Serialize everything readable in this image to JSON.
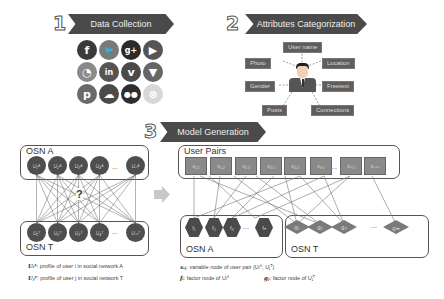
{
  "steps": [
    {
      "number": "1",
      "title": "Data Collection"
    },
    {
      "number": "2",
      "title": "Attributes Categorization"
    },
    {
      "number": "3",
      "title": "Model Generation"
    }
  ],
  "social_icons": [
    {
      "name": "facebook-icon",
      "glyph": "f",
      "color": "#3a3a3a"
    },
    {
      "name": "twitter-icon",
      "glyph": "🐦",
      "color": "#7a7a7a"
    },
    {
      "name": "google-plus-icon",
      "glyph": "g+",
      "color": "#2a2a2a"
    },
    {
      "name": "youtube-icon",
      "glyph": "▶",
      "color": "#555555"
    },
    {
      "name": "rss-icon",
      "glyph": "◔",
      "color": "#8a8a8a"
    },
    {
      "name": "linkedin-icon",
      "glyph": "in",
      "color": "#555555"
    },
    {
      "name": "vimeo-icon",
      "glyph": "v",
      "color": "#4a4a4a"
    },
    {
      "name": "foursquare-icon",
      "glyph": "▼",
      "color": "#666666"
    },
    {
      "name": "pinterest-icon",
      "glyph": "p",
      "color": "#6a6a6a"
    },
    {
      "name": "soundcloud-icon",
      "glyph": "☁",
      "color": "#4a4a4a"
    },
    {
      "name": "flickr-icon",
      "glyph": "●●",
      "color": "#2e2e2e"
    },
    {
      "name": "stumbleupon-icon",
      "glyph": "⊗",
      "color": "#d8d8d8"
    }
  ],
  "attributes": {
    "user_name": "User name",
    "photo": "Photo",
    "location": "Location",
    "gender": "Gender",
    "freetext": "Freetext",
    "posts": "Posts",
    "connections": "Connections"
  },
  "model": {
    "osn_a_label": "OSN A",
    "osn_t_label": "OSN T",
    "question_mark": "?",
    "osn_a_nodes": [
      "U₁ᴬ",
      "U₂ᴬ",
      "U₃ᴬ",
      "U₄ᴬ",
      "Uₙᴬ"
    ],
    "osn_t_nodes": [
      "U₁ᵀ",
      "U₂ᵀ",
      "U₃ᵀ",
      "U₄ᵀ",
      "Uₘᵀ"
    ],
    "ellipsis": "...",
    "user_pairs_label": "User Pairs",
    "pair_nodes": [
      "x₁,₁",
      "x₁,₂",
      "x₁,₃",
      "x₂,₁",
      "x₂,₂",
      "x₃,₁",
      "xₙ,₁",
      "xₙ,ₘ"
    ],
    "factor_a_label": "OSN A",
    "factor_t_label": "OSN T",
    "factor_a_nodes": [
      "f₁",
      "f₂",
      "f₃",
      "fₙ"
    ],
    "factor_t_nodes": [
      "g₁",
      "g₂",
      "g₃",
      "gₘ"
    ]
  },
  "legend": {
    "ua_symbol": "Uᵢᴬ",
    "ua_text": ":  profile of user i in social network A",
    "ut_symbol": "Uⱼᵀ",
    "ut_text": ":  profile of user j in social network T",
    "x_symbol": "xᵢⱼ",
    "x_text": ": variable node of user pair (Uᵢᴬ, Uⱼᵀ)",
    "f_symbol": "fᵢ",
    "f_text": ": factor node of Uᵢᴬ",
    "g_symbol": "gⱼ",
    "g_text": ": factor node of Uⱼᵀ"
  }
}
